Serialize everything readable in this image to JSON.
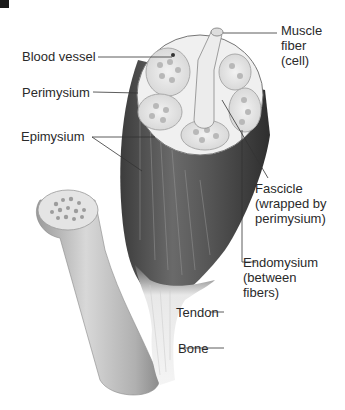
{
  "figure": {
    "labels": {
      "muscle_fiber": [
        "Muscle",
        "fiber",
        "(cell)"
      ],
      "blood_vessel": "Blood vessel",
      "perimysium": "Perimysium",
      "epimysium": "Epimysium",
      "fascicle": [
        "Fascicle",
        "(wrapped by",
        "perimysium)"
      ],
      "endomysium": [
        "Endomysium",
        "(between",
        "fibers)"
      ],
      "tendon": "Tendon",
      "bone": "Bone"
    }
  }
}
